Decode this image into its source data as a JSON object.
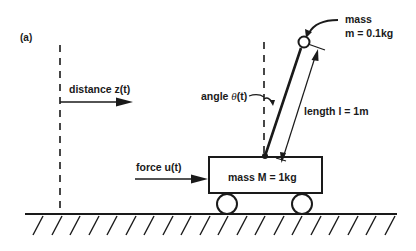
{
  "figure": {
    "panel_label": "(a)",
    "labels": {
      "distance": "distance  z(t)",
      "angle_prefix": "angle ",
      "angle_symbol": "θ",
      "angle_suffix": "(t)",
      "length": "length  l = 1m",
      "mass_title": "mass",
      "mass_value": "m = 0.1kg",
      "force": "force  u(t)",
      "cart_mass": "mass  M = 1kg"
    },
    "colors": {
      "ink": "#1a1a1a",
      "background": "#ffffff"
    }
  }
}
